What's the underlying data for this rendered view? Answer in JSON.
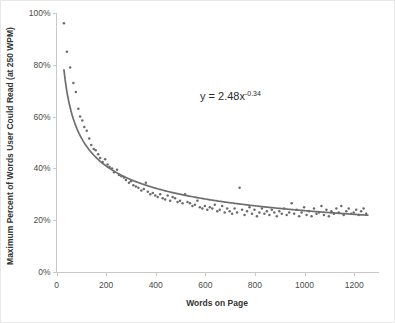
{
  "chart_data": {
    "type": "scatter",
    "title": "",
    "xlabel": "Words on Page",
    "ylabel": "Maximum Percent of Words User Could Read (at 250 WPM)",
    "xlim": [
      0,
      1300
    ],
    "ylim": [
      0,
      1.0
    ],
    "grid": false,
    "legend": null,
    "annotation": "y = 2.48x",
    "annotation_exponent": "-0.34",
    "fit": {
      "type": "power",
      "equation": "y = 2.48x^-0.34",
      "coefficient": 2.48,
      "exponent": -0.34,
      "x_range": [
        30,
        1255
      ]
    },
    "xticks": [
      0,
      200,
      400,
      600,
      800,
      1000,
      1200
    ],
    "xtick_labels": [
      "0",
      "200",
      "400",
      "600",
      "800",
      "1000",
      "1200"
    ],
    "yticks": [
      0,
      0.2,
      0.4,
      0.6,
      0.8,
      1.0
    ],
    "ytick_labels": [
      "0%",
      "20%",
      "40%",
      "60%",
      "80%",
      "100%"
    ],
    "series": [
      {
        "name": "Maximum percent readable",
        "marker": "dot",
        "color": "#6b6b6b",
        "points": [
          [
            30,
            0.96
          ],
          [
            42,
            0.85
          ],
          [
            55,
            0.79
          ],
          [
            68,
            0.73
          ],
          [
            78,
            0.695
          ],
          [
            88,
            0.63
          ],
          [
            95,
            0.6
          ],
          [
            104,
            0.585
          ],
          [
            112,
            0.56
          ],
          [
            122,
            0.545
          ],
          [
            132,
            0.515
          ],
          [
            140,
            0.49
          ],
          [
            150,
            0.475
          ],
          [
            158,
            0.47
          ],
          [
            168,
            0.455
          ],
          [
            176,
            0.44
          ],
          [
            186,
            0.425
          ],
          [
            196,
            0.435
          ],
          [
            206,
            0.415
          ],
          [
            214,
            0.405
          ],
          [
            224,
            0.4
          ],
          [
            232,
            0.385
          ],
          [
            244,
            0.395
          ],
          [
            252,
            0.375
          ],
          [
            262,
            0.37
          ],
          [
            272,
            0.365
          ],
          [
            280,
            0.355
          ],
          [
            292,
            0.345
          ],
          [
            300,
            0.35
          ],
          [
            310,
            0.335
          ],
          [
            320,
            0.33
          ],
          [
            330,
            0.325
          ],
          [
            342,
            0.315
          ],
          [
            352,
            0.32
          ],
          [
            360,
            0.345
          ],
          [
            368,
            0.31
          ],
          [
            378,
            0.3
          ],
          [
            388,
            0.305
          ],
          [
            398,
            0.295
          ],
          [
            408,
            0.29
          ],
          [
            418,
            0.3
          ],
          [
            428,
            0.285
          ],
          [
            438,
            0.28
          ],
          [
            448,
            0.295
          ],
          [
            458,
            0.275
          ],
          [
            468,
            0.29
          ],
          [
            478,
            0.285
          ],
          [
            488,
            0.27
          ],
          [
            498,
            0.275
          ],
          [
            508,
            0.265
          ],
          [
            518,
            0.3
          ],
          [
            528,
            0.27
          ],
          [
            538,
            0.265
          ],
          [
            548,
            0.255
          ],
          [
            558,
            0.26
          ],
          [
            568,
            0.275
          ],
          [
            578,
            0.25
          ],
          [
            588,
            0.245
          ],
          [
            598,
            0.255
          ],
          [
            608,
            0.24
          ],
          [
            618,
            0.25
          ],
          [
            628,
            0.245
          ],
          [
            638,
            0.26
          ],
          [
            648,
            0.235
          ],
          [
            658,
            0.24
          ],
          [
            668,
            0.255
          ],
          [
            678,
            0.23
          ],
          [
            688,
            0.245
          ],
          [
            698,
            0.235
          ],
          [
            708,
            0.225
          ],
          [
            718,
            0.245
          ],
          [
            728,
            0.23
          ],
          [
            738,
            0.325
          ],
          [
            748,
            0.24
          ],
          [
            758,
            0.22
          ],
          [
            768,
            0.235
          ],
          [
            778,
            0.25
          ],
          [
            788,
            0.225
          ],
          [
            798,
            0.24
          ],
          [
            808,
            0.215
          ],
          [
            818,
            0.23
          ],
          [
            828,
            0.245
          ],
          [
            838,
            0.225
          ],
          [
            848,
            0.235
          ],
          [
            858,
            0.22
          ],
          [
            868,
            0.24
          ],
          [
            878,
            0.23
          ],
          [
            888,
            0.215
          ],
          [
            898,
            0.235
          ],
          [
            908,
            0.225
          ],
          [
            918,
            0.245
          ],
          [
            928,
            0.22
          ],
          [
            938,
            0.23
          ],
          [
            948,
            0.265
          ],
          [
            958,
            0.225
          ],
          [
            968,
            0.24
          ],
          [
            978,
            0.215
          ],
          [
            988,
            0.23
          ],
          [
            998,
            0.25
          ],
          [
            1008,
            0.22
          ],
          [
            1018,
            0.235
          ],
          [
            1028,
            0.215
          ],
          [
            1038,
            0.245
          ],
          [
            1048,
            0.225
          ],
          [
            1058,
            0.23
          ],
          [
            1068,
            0.255
          ],
          [
            1078,
            0.22
          ],
          [
            1088,
            0.24
          ],
          [
            1098,
            0.215
          ],
          [
            1108,
            0.235
          ],
          [
            1118,
            0.225
          ],
          [
            1128,
            0.245
          ],
          [
            1138,
            0.23
          ],
          [
            1148,
            0.255
          ],
          [
            1158,
            0.22
          ],
          [
            1168,
            0.235
          ],
          [
            1178,
            0.245
          ],
          [
            1188,
            0.225
          ],
          [
            1198,
            0.23
          ],
          [
            1208,
            0.24
          ],
          [
            1218,
            0.22
          ],
          [
            1228,
            0.235
          ],
          [
            1238,
            0.245
          ],
          [
            1248,
            0.225
          ]
        ]
      }
    ]
  },
  "axes": {
    "x_title": "Words on Page",
    "y_title": "Maximum Percent of Words User Could Read (at 250 WPM)"
  },
  "annotation": {
    "base": "y = 2.48x",
    "exponent": "-0.34"
  },
  "colors": {
    "point": "#6b6b6b",
    "curve": "#6e6e6e",
    "axis": "#c9c9c9",
    "text": "#4a4a4a"
  }
}
